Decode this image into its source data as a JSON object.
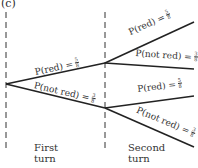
{
  "part_label": "(c)",
  "turns": {
    "first": {
      "line1": "First",
      "line2": "turn"
    },
    "second": {
      "line1": "Second",
      "line2": "turn"
    }
  },
  "branches": {
    "first_red": {
      "text": "P(red) =",
      "num": "5",
      "den": "8"
    },
    "first_not_red": {
      "text": "P(not red) =",
      "num": "3",
      "den": "8"
    },
    "second_red_red": {
      "text": "P(red) =",
      "num": "5",
      "den": "8"
    },
    "second_red_not_red": {
      "text": "P(not red) =",
      "num": "3",
      "den": "8"
    },
    "second_notred_red": {
      "text": "P(red) =",
      "num": "5",
      "den": "8"
    },
    "second_notred_not_red": {
      "text": "P(not red) =",
      "num": "3",
      "den": "8"
    }
  },
  "_note": "Second-turn numerators (5 and 3) were not clearly legible at 198x168; values assume the first-turn pattern repeats and may be wrong."
}
